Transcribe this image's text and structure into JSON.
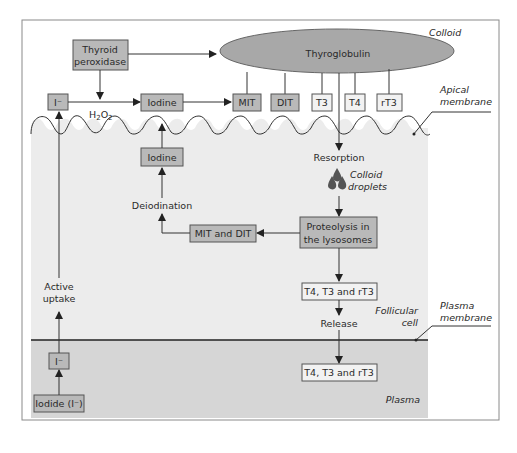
{
  "diagram": {
    "regions": {
      "colloid": "Colloid",
      "apical_membrane": [
        "Apical",
        "membrane"
      ],
      "follicular_cell": [
        "Follicular",
        "cell"
      ],
      "plasma_membrane": [
        "Plasma",
        "membrane"
      ],
      "plasma": "Plasma"
    },
    "nodes": {
      "thyroid_peroxidase": [
        "Thyroid",
        "peroxidase"
      ],
      "thyroglobulin": "Thyroglobulin",
      "iodide_ion_colloid": "I⁻",
      "h2o2": "H",
      "h2o2_sub1": "2",
      "h2o2_o": "O",
      "h2o2_sub2": "2",
      "iodine_colloid": "Iodine",
      "mit": "MIT",
      "dit": "DIT",
      "t3": "T3",
      "t4": "T4",
      "rt3": "rT3",
      "resorption": "Resorption",
      "colloid_droplets": [
        "Colloid",
        "droplets"
      ],
      "iodine_cell": "Iodine",
      "deiodination": "Deiodination",
      "proteolysis": [
        "Proteolysis in",
        "the lysosomes"
      ],
      "mit_and_dit": "MIT and DIT",
      "t4_t3_rt3_cell": "T4, T3 and rT3",
      "release": "Release",
      "t4_t3_rt3_plasma": "T4, T3 and rT3",
      "active_uptake": [
        "Active",
        "uptake"
      ],
      "iodide_ion_plasma": "I⁻",
      "iodide_plasma": "Iodide (I⁻)"
    },
    "colors": {
      "frame": "#8a8a8a",
      "cell_fill": "#ececec",
      "plasma_fill": "#d6d6d6",
      "thyroglobulin_fill": "#a8a8a8",
      "dark_box": "#b9b9b9",
      "light_box": "#f2f2f2",
      "droplet": "#555555"
    }
  }
}
